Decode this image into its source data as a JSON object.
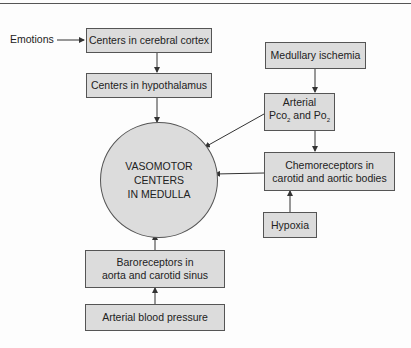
{
  "diagram": {
    "center_node": {
      "line1": "VASOMOTOR CENTERS",
      "line2": "IN MEDULLA"
    },
    "left_label": "Emotions",
    "nodes": {
      "cortex": "Centers in cerebral cortex",
      "hypothalamus": "Centers in hypothalamus",
      "baroreceptors": {
        "line1": "Baroreceptors in",
        "line2": "aorta and carotid sinus"
      },
      "arterial_bp": "Arterial blood pressure",
      "ischemia": "Medullary ischemia",
      "gases": {
        "line1": "Arterial",
        "pco": "Pco",
        "sub1": "2",
        "and": " and Po",
        "sub2": "2"
      },
      "chemoreceptors": {
        "line1": "Chemoreceptors in",
        "line2": "carotid and aortic bodies"
      },
      "hypoxia": "Hypoxia"
    },
    "edges": [
      [
        "Emotions",
        "Centers in cerebral cortex"
      ],
      [
        "Centers in cerebral cortex",
        "Centers in hypothalamus"
      ],
      [
        "Centers in hypothalamus",
        "VASOMOTOR CENTERS IN MEDULLA"
      ],
      [
        "Medullary ischemia",
        "Arterial Pco2 and Po2"
      ],
      [
        "Arterial Pco2 and Po2",
        "VASOMOTOR CENTERS IN MEDULLA"
      ],
      [
        "Arterial Pco2 and Po2",
        "Chemoreceptors in carotid and aortic bodies"
      ],
      [
        "Chemoreceptors in carotid and aortic bodies",
        "VASOMOTOR CENTERS IN MEDULLA"
      ],
      [
        "Hypoxia",
        "Chemoreceptors in carotid and aortic bodies"
      ],
      [
        "Arterial blood pressure",
        "Baroreceptors in aorta and carotid sinus"
      ],
      [
        "Baroreceptors in aorta and carotid sinus",
        "VASOMOTOR CENTERS IN MEDULLA"
      ]
    ]
  }
}
